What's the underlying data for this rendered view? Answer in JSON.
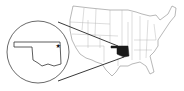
{
  "map": {
    "region": "United States",
    "highlighted_state": "Oklahoma",
    "highlight_color": "#1a1a1a",
    "outline_color": "#6a6a6a",
    "inset": {
      "shape": "circle",
      "content": "Oklahoma outline",
      "marker": "star",
      "marker_position": "northeast"
    }
  }
}
